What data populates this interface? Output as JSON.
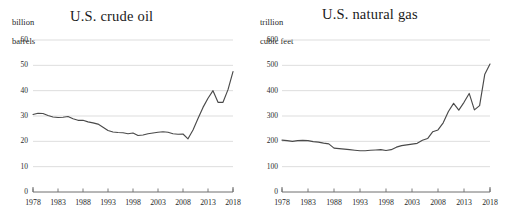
{
  "figure": {
    "background": "#ffffff",
    "line_color": "#4a4a4a",
    "grid_color": "#d4d4d4",
    "axis_color": "#6e6e6e"
  },
  "panels": [
    {
      "id": "oil",
      "title": "U.S. crude oil",
      "unit_label": "billion\nbarrels",
      "unit_line1": "billion",
      "unit_line2": "barrels"
    },
    {
      "id": "gas",
      "title": "U.S. natural gas",
      "unit_label": "trillion\ncubic feet",
      "unit_line1": "trillion",
      "unit_line2": "cubic feet"
    }
  ],
  "chart_data": [
    {
      "type": "line",
      "title": "U.S. crude oil",
      "xlabel": "",
      "ylabel": "billion barrels",
      "xlim": [
        1978,
        2018
      ],
      "ylim": [
        0,
        60
      ],
      "grid": "horizontal",
      "legend": "none",
      "yticks": [
        0,
        10,
        20,
        30,
        40,
        50,
        60
      ],
      "xticks": [
        1978,
        1983,
        1988,
        1993,
        1998,
        2003,
        2008,
        2013,
        2018
      ],
      "x": [
        1978,
        1979,
        1980,
        1981,
        1982,
        1983,
        1984,
        1985,
        1986,
        1987,
        1988,
        1989,
        1990,
        1991,
        1992,
        1993,
        1994,
        1995,
        1996,
        1997,
        1998,
        1999,
        2000,
        2001,
        2002,
        2003,
        2004,
        2005,
        2006,
        2007,
        2008,
        2009,
        2010,
        2011,
        2012,
        2013,
        2014,
        2015,
        2016,
        2017,
        2018
      ],
      "values": [
        30.6,
        31.1,
        31.0,
        30.2,
        29.6,
        29.4,
        29.5,
        29.8,
        28.9,
        28.3,
        28.3,
        27.7,
        27.3,
        26.8,
        25.6,
        24.3,
        23.7,
        23.5,
        23.4,
        23.0,
        23.3,
        22.3,
        22.5,
        23.0,
        23.3,
        23.6,
        23.8,
        23.6,
        23.0,
        22.8,
        22.9,
        21.0,
        24.5,
        29.0,
        33.4,
        37.0,
        40.0,
        35.4,
        35.4,
        40.4,
        47.5
      ],
      "series_name": "U.S. crude oil proved reserves"
    },
    {
      "type": "line",
      "title": "U.S. natural gas",
      "xlabel": "",
      "ylabel": "trillion cubic feet",
      "xlim": [
        1978,
        2018
      ],
      "ylim": [
        0,
        600
      ],
      "grid": "horizontal",
      "legend": "none",
      "yticks": [
        0,
        100,
        200,
        300,
        400,
        500,
        600
      ],
      "xticks": [
        1978,
        1983,
        1988,
        1993,
        1998,
        2003,
        2008,
        2013,
        2018
      ],
      "x": [
        1978,
        1979,
        1980,
        1981,
        1982,
        1983,
        1984,
        1985,
        1986,
        1987,
        1988,
        1989,
        1990,
        1991,
        1992,
        1993,
        1994,
        1995,
        1996,
        1997,
        1998,
        1999,
        2000,
        2001,
        2002,
        2003,
        2004,
        2005,
        2006,
        2007,
        2008,
        2009,
        2010,
        2011,
        2012,
        2013,
        2014,
        2015,
        2016,
        2017,
        2018
      ],
      "values": [
        205,
        203,
        200,
        203,
        204,
        203,
        199,
        197,
        193,
        190,
        173,
        171,
        169,
        167,
        165,
        163,
        163,
        165,
        166,
        167,
        164,
        167,
        177,
        183,
        186,
        189,
        192,
        204,
        211,
        238,
        245,
        273,
        318,
        350,
        323,
        354,
        389,
        324,
        341,
        465,
        505
      ],
      "series_name": "U.S. natural gas proved reserves"
    }
  ]
}
